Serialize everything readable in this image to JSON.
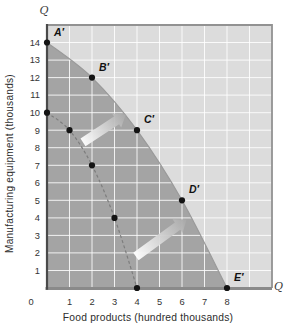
{
  "chart_data": {
    "type": "line",
    "subtype": "production-possibilities-frontier",
    "title": "",
    "xlabel": "Food products (hundred thousands)",
    "ylabel": "Manufacturing equipment (thousands)",
    "axis_symbols": {
      "top": "Q",
      "right": "Q"
    },
    "x_ticks": [
      0,
      1,
      2,
      3,
      4,
      5,
      6,
      7,
      8
    ],
    "y_ticks": [
      1,
      2,
      3,
      4,
      5,
      6,
      7,
      8,
      9,
      10,
      11,
      12,
      13,
      14
    ],
    "xlim": [
      0,
      10
    ],
    "ylim": [
      0,
      15
    ],
    "grid": true,
    "series": [
      {
        "name": "expanded-ppf",
        "line_style": "solid",
        "points": [
          {
            "x": 0,
            "y": 14,
            "label": "A′"
          },
          {
            "x": 2,
            "y": 12,
            "label": "B′"
          },
          {
            "x": 4,
            "y": 9,
            "label": "C′"
          },
          {
            "x": 6,
            "y": 5,
            "label": "D′"
          },
          {
            "x": 8,
            "y": 0,
            "label": "E′"
          }
        ]
      },
      {
        "name": "original-ppf",
        "line_style": "dashed",
        "points": [
          {
            "x": 0,
            "y": 10
          },
          {
            "x": 1,
            "y": 9
          },
          {
            "x": 2,
            "y": 7
          },
          {
            "x": 3,
            "y": 4
          },
          {
            "x": 4,
            "y": 0
          }
        ]
      }
    ],
    "arrows": [
      {
        "from": {
          "x": 1.6,
          "y": 8.3
        },
        "to": {
          "x": 3.5,
          "y": 9.9
        }
      },
      {
        "from": {
          "x": 3.95,
          "y": 1.8
        },
        "to": {
          "x": 6.2,
          "y": 3.9
        }
      }
    ],
    "colors": {
      "attainable_region": "#a4a4a4",
      "unattainable_region": "#dcdcdc",
      "gridline": "#ffffff",
      "left_axis": "#4a4a4a",
      "bottom_axis": "#8a8a8a",
      "plot_border": "#929292",
      "curve_edge": "#9a9a9a",
      "dashed_curve": "#7d7d7d",
      "point_dot": "#141414",
      "label_text": "#111111",
      "tick_text": "#333333",
      "arrow_gradient_start": "#ffffff",
      "arrow_gradient_end": "#a8a8a8"
    }
  }
}
